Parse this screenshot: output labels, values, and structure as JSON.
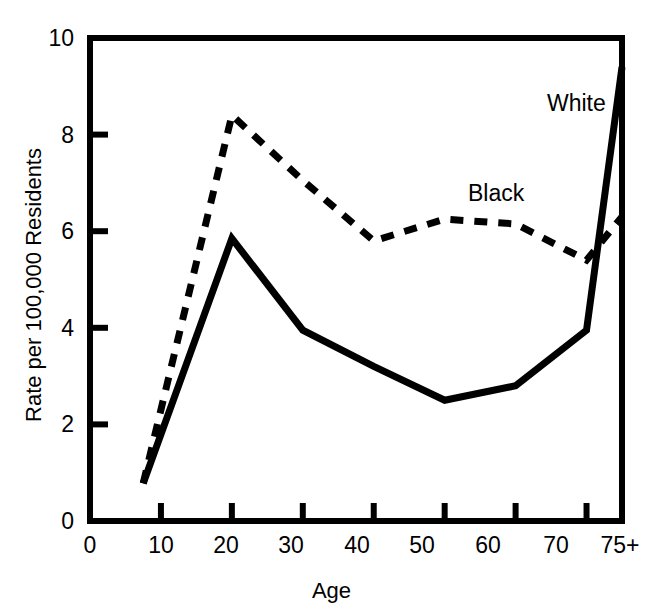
{
  "chart_data": {
    "type": "line",
    "title": "",
    "xlabel": "Age",
    "ylabel": "Rate per 100,000 Residents",
    "x": [
      7.5,
      20,
      30,
      40,
      50,
      60,
      75
    ],
    "xtick_labels": [
      "0",
      "10",
      "20",
      "30",
      "40",
      "50",
      "60",
      "70",
      "75+"
    ],
    "xtick_values": [
      0,
      10,
      20,
      30,
      40,
      50,
      60,
      70,
      75
    ],
    "ytick_labels": [
      "0",
      "2",
      "4",
      "6",
      "8",
      "10"
    ],
    "ytick_values": [
      0,
      2,
      4,
      6,
      8,
      10
    ],
    "xlim": [
      0,
      75
    ],
    "ylim": [
      0,
      10
    ],
    "grid": false,
    "legend_position": "inline-annotation",
    "series": [
      {
        "name": "Black",
        "style": "dashed",
        "color": "#000000",
        "x": [
          7.5,
          20,
          30,
          40,
          50,
          60,
          70,
          75
        ],
        "values": [
          0.78,
          8.4,
          7.05,
          5.8,
          6.25,
          6.15,
          5.4,
          6.3
        ]
      },
      {
        "name": "White",
        "style": "solid",
        "color": "#000000",
        "x": [
          7.5,
          20,
          30,
          40,
          50,
          60,
          70,
          75
        ],
        "values": [
          0.78,
          5.85,
          3.95,
          3.2,
          2.5,
          2.8,
          3.95,
          9.4
        ]
      }
    ],
    "annotations": [
      {
        "text": "White",
        "x": 68,
        "y": 8.9
      },
      {
        "text": "Black",
        "x": 58,
        "y": 7.0
      }
    ]
  },
  "axes": {
    "x_title": "Age",
    "y_title": "Rate per 100,000 Residents"
  },
  "labels": {
    "white": "White",
    "black": "Black"
  },
  "yticks": {
    "t0": "0",
    "t1": "2",
    "t2": "4",
    "t3": "6",
    "t4": "8",
    "t5": "10"
  },
  "xticks": {
    "t0": "0",
    "t1": "10",
    "t2": "20",
    "t3": "30",
    "t4": "40",
    "t5": "50",
    "t6": "60",
    "t7": "70",
    "t8": "75+"
  },
  "colors": {
    "ink": "#000000",
    "background": "#ffffff"
  }
}
